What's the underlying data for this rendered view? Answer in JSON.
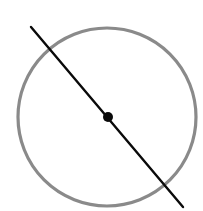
{
  "diagram": {
    "width": 203,
    "height": 211,
    "background": "#ffffff",
    "circle": {
      "cx": 107,
      "cy": 117,
      "r": 89,
      "stroke": "#8a8a8a",
      "stroke_width": 3.2
    },
    "line": {
      "x1": 31,
      "y1": 27,
      "x2": 183,
      "y2": 207,
      "stroke": "#0a0a0a",
      "stroke_width": 2.4
    },
    "center_point": {
      "cx": 108,
      "cy": 117,
      "r": 5,
      "fill": "#0a0a0a"
    }
  }
}
